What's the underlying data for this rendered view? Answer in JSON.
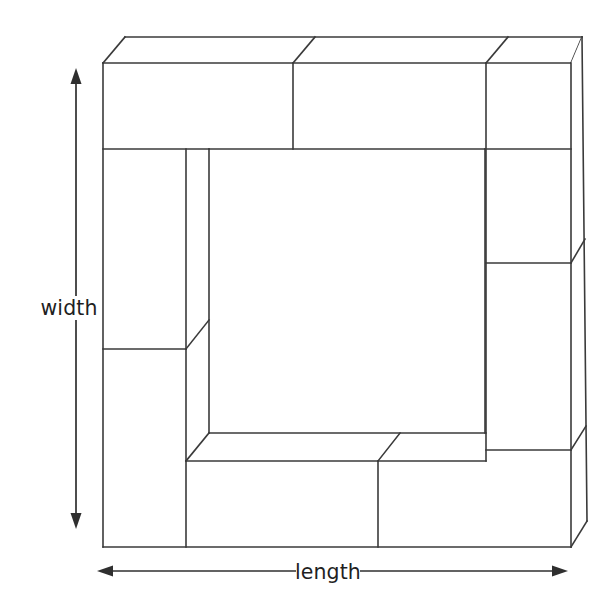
{
  "figure": {
    "type": "technical-line-diagram",
    "background_color": "#ffffff",
    "line_color": "#3a3a3a",
    "label_color": "#1f1f1f",
    "line_width_px": 1.6
  },
  "labels": {
    "width": "width",
    "length": "length"
  },
  "dimensions": {
    "width_arrow": {
      "orientation": "vertical",
      "x": 76,
      "y_top": 70,
      "y_bottom": 527,
      "both_ends_arrow": true
    },
    "length_arrow": {
      "orientation": "horizontal",
      "y": 571,
      "x_left": 98,
      "x_right": 567,
      "both_ends_arrow": true,
      "label_gap_left": 296,
      "label_gap_right": 360
    }
  },
  "geometry": {
    "front_face": {
      "left": 103,
      "top": 63,
      "right": 571,
      "bottom": 547
    },
    "cavity": {
      "left": 209,
      "top": 149,
      "right": 485,
      "bottom": 433
    },
    "depth_offset": {
      "dx": 22,
      "dy": -26
    },
    "top_back_left": {
      "x": 125,
      "y": 37
    },
    "top_back_right": {
      "x": 582,
      "y": 37
    },
    "right_back_bottom": {
      "x": 587,
      "y": 521
    }
  },
  "bricks": {
    "top_row_divider_x": 293,
    "top_row_right_divider_x": 486,
    "left_column_divider_y": 349,
    "right_column_divider_y": 263,
    "right_column_lower_divider_y": 450,
    "bottom_row_divider_x": 378,
    "bottom_front_top_y": 461,
    "inner_left_column_x": 186
  }
}
